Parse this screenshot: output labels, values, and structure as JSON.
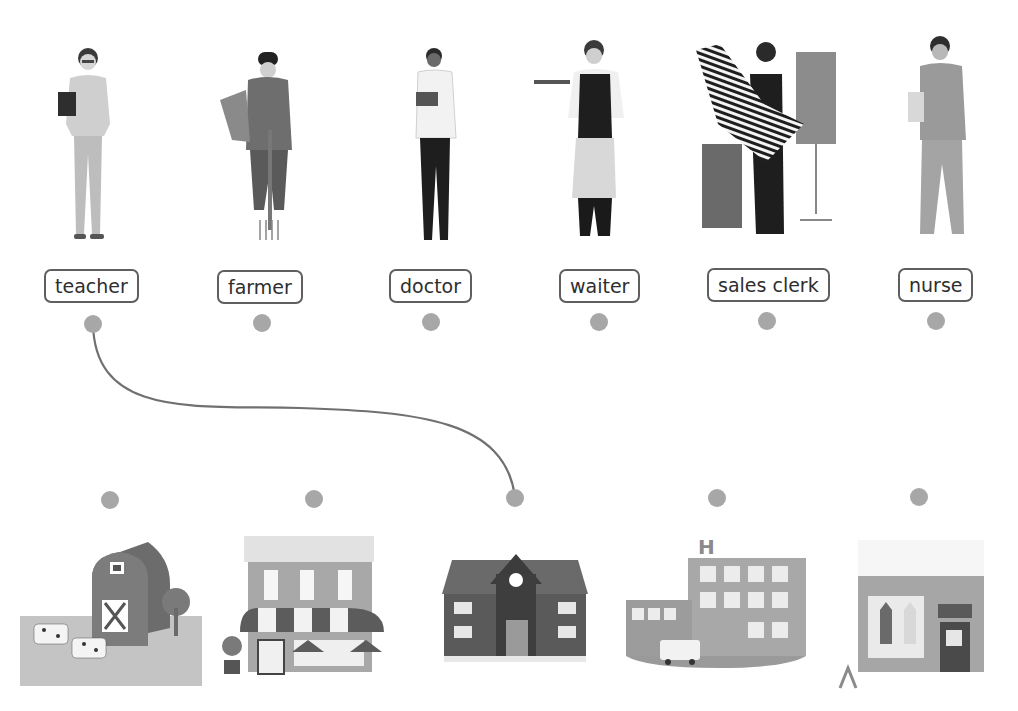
{
  "exercise": {
    "type": "matching",
    "instruction_visible": false
  },
  "jobs": [
    {
      "id": "teacher",
      "label": "teacher",
      "image": "teacher-photo-icon"
    },
    {
      "id": "farmer",
      "label": "farmer",
      "image": "farmer-photo-icon"
    },
    {
      "id": "doctor",
      "label": "doctor",
      "image": "doctor-photo-icon"
    },
    {
      "id": "waiter",
      "label": "waiter",
      "image": "waiter-photo-icon"
    },
    {
      "id": "sales_clerk",
      "label": "sales clerk",
      "image": "sales-clerk-photo-icon"
    },
    {
      "id": "nurse",
      "label": "nurse",
      "image": "nurse-photo-icon"
    }
  ],
  "places": [
    {
      "id": "farm",
      "image": "farm-barn-icon"
    },
    {
      "id": "restaurant",
      "image": "cafe-restaurant-icon"
    },
    {
      "id": "school",
      "image": "school-building-icon"
    },
    {
      "id": "hospital",
      "image": "hospital-building-icon",
      "sign": "H"
    },
    {
      "id": "clothes_store",
      "image": "clothing-store-icon"
    }
  ],
  "connections": [
    {
      "from": "teacher",
      "to": "school"
    }
  ],
  "colors": {
    "dot": "#a7a7a7",
    "line": "#707070",
    "label_border": "#5f5f5f",
    "label_text": "#2e2e2e"
  }
}
